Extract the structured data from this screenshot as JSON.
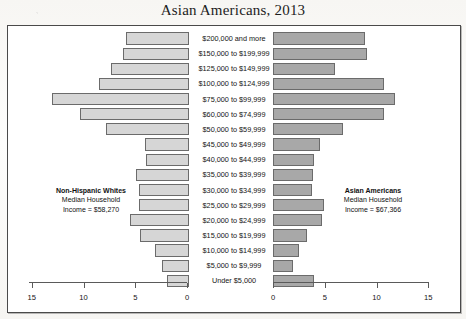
{
  "figure": {
    "title": "Asian Americans, 2013"
  },
  "annotations": {
    "left": {
      "name": "Non-Hispanic Whites",
      "line2": "Median Household",
      "line3": "Income = $58,270"
    },
    "right": {
      "name": "Asian Americans",
      "line2": "Median Household",
      "line3": "Income = $67,366"
    }
  },
  "axes": {
    "left_ticks": [
      "15",
      "10",
      "5",
      "0"
    ],
    "right_ticks": [
      "0",
      "5",
      "10",
      "15"
    ]
  },
  "chart_data": {
    "type": "bar",
    "title": "Asian Americans, 2013",
    "orientation": "horizontal-diverging",
    "xlabel": "",
    "ylabel": "",
    "xlim_left": [
      15,
      0
    ],
    "xlim_right": [
      0,
      15
    ],
    "grid": false,
    "legend": "inline-annotations",
    "categories": [
      "$200,000 and more",
      "$150,000 to $199,999",
      "$125,000 to $149,999",
      "$100,000 to $124,999",
      "$75,000 to $99,999",
      "$60,000 to $74,999",
      "$50,000 to $59,999",
      "$45,000 to $49,999",
      "$40,000 to $44,999",
      "$35,000 to $39,999",
      "$30,000 to $34,999",
      "$25,000 to $29,999",
      "$20,000 to $24,999",
      "$15,000 to $19,999",
      "$10,000 to $14,999",
      "$5,000 to $9,999",
      "Under $5,000"
    ],
    "series": [
      {
        "name": "Non-Hispanic Whites",
        "side": "left",
        "color": "#d6d6d6",
        "values": [
          6.1,
          6.4,
          7.5,
          8.7,
          13.2,
          10.5,
          8.0,
          4.3,
          4.2,
          5.1,
          4.8,
          4.8,
          5.7,
          4.7,
          3.3,
          2.6,
          2.1
        ]
      },
      {
        "name": "Asian Americans",
        "side": "right",
        "color": "#a8a8a8",
        "values": [
          8.9,
          9.1,
          6.0,
          10.7,
          11.8,
          10.7,
          6.8,
          4.5,
          4.0,
          3.9,
          3.8,
          4.9,
          4.7,
          3.3,
          2.5,
          1.9,
          4.0
        ]
      }
    ]
  }
}
